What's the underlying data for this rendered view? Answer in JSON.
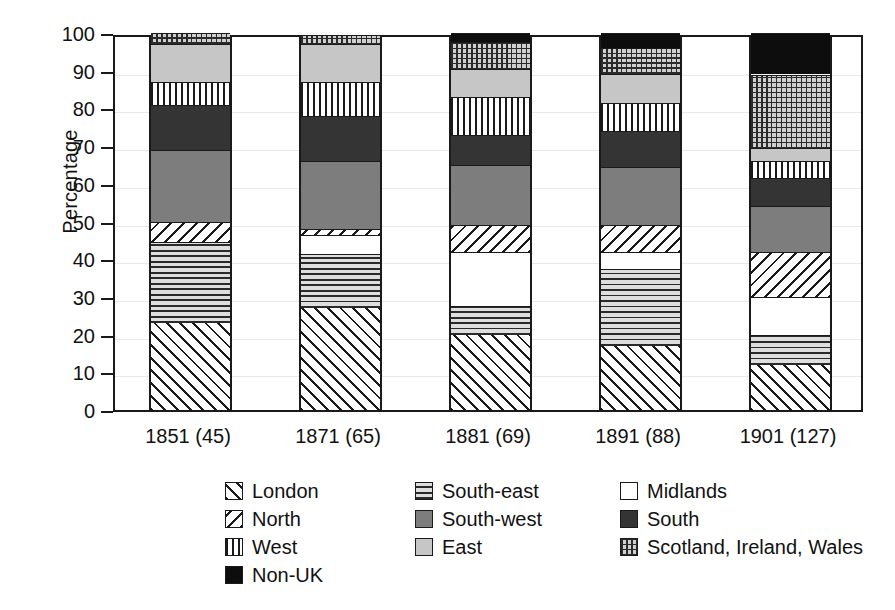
{
  "chart_data": {
    "type": "bar",
    "subtype": "stacked-100-percent",
    "title": "",
    "xlabel": "",
    "ylabel": "Percentage",
    "ylim": [
      0,
      100
    ],
    "yticks": [
      0,
      10,
      20,
      30,
      40,
      50,
      60,
      70,
      80,
      90,
      100
    ],
    "grid": true,
    "legend_position": "below",
    "categories": [
      "1851 (45)",
      "1871 (65)",
      "1881 (69)",
      "1891 (88)",
      "1901 (127)"
    ],
    "series": [
      {
        "name": "London",
        "pattern": "diagonal-hatch-forward",
        "values": [
          23.0,
          27.0,
          20.0,
          17.0,
          12.0
        ]
      },
      {
        "name": "South-east",
        "pattern": "horizontal-lines",
        "values": [
          21.5,
          14.5,
          7.5,
          20.5,
          8.0
        ]
      },
      {
        "name": "Midlands",
        "pattern": "white",
        "values": [
          0.0,
          5.0,
          14.5,
          4.5,
          10.0
        ]
      },
      {
        "name": "North",
        "pattern": "diagonal-hatch-back",
        "values": [
          5.5,
          1.5,
          7.0,
          7.0,
          12.0
        ]
      },
      {
        "name": "South-west",
        "pattern": "medium-gray",
        "values": [
          19.0,
          18.0,
          16.0,
          15.5,
          12.0
        ]
      },
      {
        "name": "South",
        "pattern": "dark-gray",
        "values": [
          12.0,
          12.0,
          8.0,
          9.5,
          7.5
        ]
      },
      {
        "name": "West",
        "pattern": "vertical-lines",
        "values": [
          6.0,
          9.0,
          10.0,
          7.5,
          4.5
        ]
      },
      {
        "name": "East",
        "pattern": "light-gray",
        "values": [
          10.0,
          10.0,
          7.5,
          7.5,
          3.5
        ]
      },
      {
        "name": "Scotland, Ireland, Wales",
        "pattern": "cross-hatch-grid",
        "values": [
          3.0,
          2.5,
          7.0,
          7.0,
          19.5
        ]
      },
      {
        "name": "Non-UK",
        "pattern": "solid-black",
        "values": [
          0.0,
          0.0,
          2.5,
          4.0,
          11.0
        ]
      }
    ]
  },
  "axes": {
    "ylabel": "Percentage",
    "yticklabels": [
      "0",
      "10",
      "20",
      "30",
      "40",
      "50",
      "60",
      "70",
      "80",
      "90",
      "100"
    ],
    "xticklabels": [
      "1851 (45)",
      "1871 (65)",
      "1881 (69)",
      "1891 (88)",
      "1901 (127)"
    ]
  },
  "legend": {
    "columns": [
      {
        "items": [
          {
            "label": "London",
            "key": "p-london"
          },
          {
            "label": "North",
            "key": "p-north"
          },
          {
            "label": "West",
            "key": "p-west"
          },
          {
            "label": "Non-UK",
            "key": "p-nonuk"
          }
        ]
      },
      {
        "items": [
          {
            "label": "South-east",
            "key": "p-southeast"
          },
          {
            "label": "South-west",
            "key": "p-southwest"
          },
          {
            "label": "East",
            "key": "p-east"
          }
        ]
      },
      {
        "items": [
          {
            "label": "Midlands",
            "key": "p-midlands"
          },
          {
            "label": "South",
            "key": "p-south"
          },
          {
            "label": "Scotland, Ireland, Wales",
            "key": "p-siw"
          }
        ]
      }
    ]
  },
  "colors": {
    "axis": "#1a1a1a",
    "grid": "#e9e9e9",
    "non_uk": "#0d0d0d",
    "south": "#343434",
    "south_west": "#7d7d7d",
    "east": "#c6c6c6",
    "midlands": "#ffffff",
    "background": "#ffffff"
  }
}
